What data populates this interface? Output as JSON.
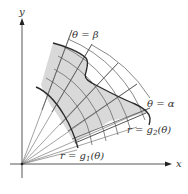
{
  "diagram": {
    "type": "polar-region",
    "axes": {
      "x_label": "x",
      "y_label": "y"
    },
    "labels": {
      "theta_beta": "θ = β",
      "theta_alpha": "θ = α",
      "r_g2": "r = g",
      "r_g2_sub": "2",
      "r_g2_arg": "(θ)",
      "r_g1": "r = g",
      "r_g1_sub": "1",
      "r_g1_arg": "(θ)"
    },
    "colors": {
      "region_fill": "#d9d9d9",
      "grid_line": "#666666",
      "boundary": "#333333",
      "axis": "#444444",
      "ray": "#888888"
    }
  }
}
